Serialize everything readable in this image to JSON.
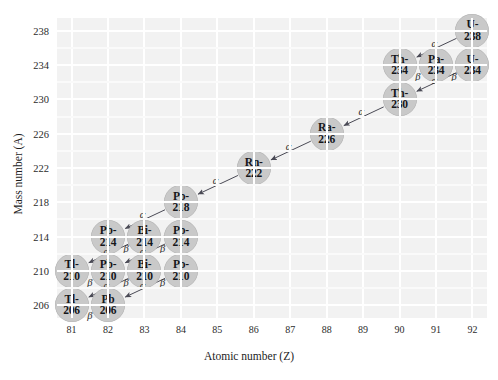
{
  "axes": {
    "xlabel": "Atomic number (Z)",
    "ylabel": "Mass number (A)",
    "xticks": [
      81,
      82,
      83,
      84,
      85,
      86,
      87,
      88,
      89,
      90,
      91,
      92
    ],
    "yticks": [
      206,
      210,
      214,
      218,
      222,
      226,
      230,
      234,
      238
    ],
    "xlim": [
      80.6,
      92.4
    ],
    "ylim": [
      204.5,
      239.5
    ],
    "grid": true,
    "plot_bg": "#f2f2f2",
    "grid_color": "#ffffff"
  },
  "chart_data": {
    "type": "scatter",
    "title": "",
    "xlabel": "Atomic number (Z)",
    "ylabel": "Mass number (A)",
    "xlim": [
      80.6,
      92.4
    ],
    "ylim": [
      204.5,
      239.5
    ],
    "grid": true,
    "legend": "none",
    "node_color": "#c9c9c9",
    "nodes": [
      {
        "sym": "U-",
        "mass": "238",
        "z": 92,
        "a": 238
      },
      {
        "sym": "Th-",
        "mass": "234",
        "z": 90,
        "a": 234
      },
      {
        "sym": "Pa-",
        "mass": "234",
        "z": 91,
        "a": 234
      },
      {
        "sym": "U-",
        "mass": "234",
        "z": 92,
        "a": 234
      },
      {
        "sym": "Th-",
        "mass": "230",
        "z": 90,
        "a": 230
      },
      {
        "sym": "Ra-",
        "mass": "226",
        "z": 88,
        "a": 226
      },
      {
        "sym": "Rn-",
        "mass": "222",
        "z": 86,
        "a": 222
      },
      {
        "sym": "Po-",
        "mass": "218",
        "z": 84,
        "a": 218
      },
      {
        "sym": "Pb-",
        "mass": "214",
        "z": 82,
        "a": 214
      },
      {
        "sym": "Bi-",
        "mass": "214",
        "z": 83,
        "a": 214
      },
      {
        "sym": "Po-",
        "mass": "214",
        "z": 84,
        "a": 214
      },
      {
        "sym": "Tl-",
        "mass": "210",
        "z": 81,
        "a": 210
      },
      {
        "sym": "Pb-",
        "mass": "210",
        "z": 82,
        "a": 210
      },
      {
        "sym": "Bi-",
        "mass": "210",
        "z": 83,
        "a": 210
      },
      {
        "sym": "Po-",
        "mass": "210",
        "z": 84,
        "a": 210
      },
      {
        "sym": "Tl-",
        "mass": "206",
        "z": 81,
        "a": 206
      },
      {
        "sym": "Pb",
        "mass": "206",
        "z": 82,
        "a": 206
      }
    ],
    "decays": [
      {
        "label": "α",
        "kind": "alpha",
        "from": [
          92,
          238
        ],
        "to": [
          90,
          234
        ],
        "lx": 90.95,
        "ly": 236.6
      },
      {
        "label": "β",
        "kind": "beta",
        "from": [
          91,
          234
        ],
        "to": [
          90,
          234
        ],
        "lx": 90.5,
        "ly": 232.7
      },
      {
        "label": "β",
        "kind": "beta",
        "from": [
          92,
          234
        ],
        "to": [
          91,
          234
        ],
        "lx": 91.5,
        "ly": 232.7
      },
      {
        "label": "α",
        "kind": "alpha",
        "from": [
          92,
          234
        ],
        "to": [
          90,
          230
        ],
        "lx": 90.95,
        "ly": 232.3
      },
      {
        "label": "α",
        "kind": "alpha",
        "from": [
          90,
          230
        ],
        "to": [
          88,
          226
        ],
        "lx": 88.95,
        "ly": 228.6
      },
      {
        "label": "α",
        "kind": "alpha",
        "from": [
          88,
          226
        ],
        "to": [
          86,
          222
        ],
        "lx": 86.95,
        "ly": 224.6
      },
      {
        "label": "α",
        "kind": "alpha",
        "from": [
          86,
          222
        ],
        "to": [
          84,
          218
        ],
        "lx": 84.95,
        "ly": 220.6
      },
      {
        "label": "α",
        "kind": "alpha",
        "from": [
          84,
          218
        ],
        "to": [
          82,
          214
        ],
        "lx": 82.95,
        "ly": 216.6
      },
      {
        "label": "β",
        "kind": "beta",
        "from": [
          83,
          214
        ],
        "to": [
          82,
          214
        ],
        "lx": 82.5,
        "ly": 212.7
      },
      {
        "label": "β",
        "kind": "beta",
        "from": [
          84,
          214
        ],
        "to": [
          83,
          214
        ],
        "lx": 83.5,
        "ly": 212.7
      },
      {
        "label": "α",
        "kind": "alpha",
        "from": [
          83,
          214
        ],
        "to": [
          81,
          210
        ],
        "lx": 81.95,
        "ly": 212.3
      },
      {
        "label": "α",
        "kind": "alpha",
        "from": [
          84,
          214
        ],
        "to": [
          82,
          210
        ],
        "lx": 82.95,
        "ly": 212.3
      },
      {
        "label": "β",
        "kind": "beta",
        "from": [
          82,
          210
        ],
        "to": [
          81,
          210
        ],
        "lx": 81.5,
        "ly": 208.7
      },
      {
        "label": "β",
        "kind": "beta",
        "from": [
          83,
          210
        ],
        "to": [
          82,
          210
        ],
        "lx": 82.5,
        "ly": 208.7
      },
      {
        "label": "β",
        "kind": "beta",
        "from": [
          84,
          210
        ],
        "to": [
          83,
          210
        ],
        "lx": 83.5,
        "ly": 208.7
      },
      {
        "label": "α",
        "kind": "alpha",
        "from": [
          83,
          210
        ],
        "to": [
          81,
          206
        ],
        "lx": 81.95,
        "ly": 208.3
      },
      {
        "label": "α",
        "kind": "alpha",
        "from": [
          84,
          210
        ],
        "to": [
          82,
          206
        ],
        "lx": 82.95,
        "ly": 208.3
      },
      {
        "label": "β",
        "kind": "beta",
        "from": [
          82,
          206
        ],
        "to": [
          81,
          206
        ],
        "lx": 81.5,
        "ly": 204.8
      }
    ]
  }
}
